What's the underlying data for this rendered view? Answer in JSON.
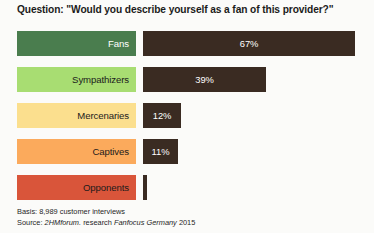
{
  "title": "Question: \"Would you describe yourself as a fan of this provider?\"",
  "footnote": {
    "basis": "Basis: 8,989 customer interviews",
    "source_prefix": "Source: ",
    "source_org": "2HMforum.",
    "source_mid": " research ",
    "source_study": "Fanfocus Germany",
    "source_year": " 2015"
  },
  "chart_data": {
    "type": "bar",
    "orientation": "horizontal",
    "title": "Question: \"Would you describe yourself as a fan of this provider?\"",
    "xlabel": "",
    "ylabel": "",
    "xlim": [
      0,
      100
    ],
    "grid": false,
    "legend": false,
    "bar_color": "#3a2b22",
    "value_suffix": "%",
    "categories": [
      "Fans",
      "Sympathizers",
      "Mercenaries",
      "Captives",
      "Opponents"
    ],
    "values": [
      67,
      39,
      12,
      11,
      1
    ],
    "value_labels": [
      "67%",
      "39%",
      "12%",
      "11%",
      ""
    ],
    "category_colors": [
      "#4a7d4e",
      "#a8dd72",
      "#fbdf8e",
      "#fbaa5c",
      "#d9553a"
    ],
    "category_text_colors": [
      "#ffffff",
      "#1b1b1b",
      "#1b1b1b",
      "#1b1b1b",
      "#1b1b1b"
    ],
    "bars": [
      {
        "category": "Fans",
        "value": 67,
        "label": "67%",
        "box_color": "#4a7d4e",
        "text_color": "#ffffff",
        "bar_width_px": 212,
        "label_visible": true
      },
      {
        "category": "Sympathizers",
        "value": 39,
        "label": "39%",
        "box_color": "#a8dd72",
        "text_color": "#1b1b1b",
        "bar_width_px": 123,
        "label_visible": true
      },
      {
        "category": "Mercenaries",
        "value": 12,
        "label": "12%",
        "box_color": "#fbdf8e",
        "text_color": "#1b1b1b",
        "bar_width_px": 38,
        "label_visible": true
      },
      {
        "category": "Captives",
        "value": 11,
        "label": "11%",
        "box_color": "#fbaa5c",
        "text_color": "#1b1b1b",
        "bar_width_px": 35,
        "label_visible": true
      },
      {
        "category": "Opponents",
        "value": 1,
        "label": "",
        "box_color": "#d9553a",
        "text_color": "#1b1b1b",
        "bar_width_px": 4,
        "label_visible": false
      }
    ]
  }
}
